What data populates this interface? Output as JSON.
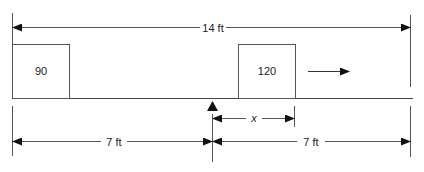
{
  "diagram": {
    "type": "seesaw-balance",
    "total_length_label": "14 ft",
    "left_half_label": "7 ft",
    "right_half_label": "7 ft",
    "unknown_distance_label": "x",
    "masses": [
      {
        "label": "90",
        "position": "left end"
      },
      {
        "label": "120",
        "position": "right of fulcrum at distance x"
      }
    ],
    "motion_arrow": "right",
    "fulcrum": "center",
    "colors": {
      "line": "#333333",
      "text": "#222222",
      "background": "#ffffff"
    }
  }
}
